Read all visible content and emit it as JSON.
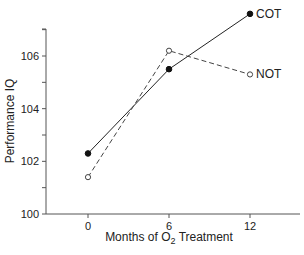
{
  "chart_data": {
    "type": "line",
    "title": "",
    "xlabel": "Months of O2 Treatment",
    "xlabel_parts": {
      "pre": "Months of O",
      "sub": "2",
      "post": " Treatment"
    },
    "ylabel": "Performance IQ",
    "x": [
      0,
      6,
      12
    ],
    "x_ticks": [
      "0",
      "6",
      "12"
    ],
    "y_ticks": [
      "100",
      "102",
      "104",
      "106"
    ],
    "ylim": [
      100,
      107.6
    ],
    "xlim": [
      -5.2,
      15
    ],
    "grid": false,
    "legend_position": "inline-right",
    "series": [
      {
        "name": "COT",
        "values": [
          102.3,
          105.5,
          107.6
        ],
        "line": "solid",
        "marker": "filled-circle",
        "color": "#222222"
      },
      {
        "name": "NOT",
        "values": [
          101.4,
          106.2,
          105.3
        ],
        "line": "dashed",
        "marker": "open-circle",
        "color": "#444444"
      }
    ]
  }
}
